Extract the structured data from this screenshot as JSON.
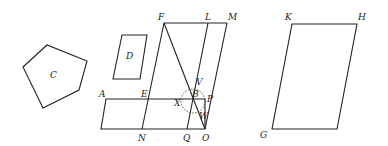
{
  "figure": {
    "shapes": {
      "pentagon": {
        "label": "C"
      },
      "small_parallelogram": {
        "label": "D"
      },
      "target_parallelogram": {
        "labels": [
          "K",
          "H",
          "G"
        ]
      }
    },
    "construction_labels": {
      "A": "A",
      "E": "E",
      "F": "F",
      "L": "L",
      "M": "M",
      "B": "B",
      "V": "V",
      "X": "X",
      "P": "P",
      "W": "W",
      "N": "N",
      "Q": "Q",
      "O": "O"
    },
    "labels": {
      "C": "C",
      "D": "D",
      "K": "K",
      "H": "H",
      "G": "G"
    }
  }
}
